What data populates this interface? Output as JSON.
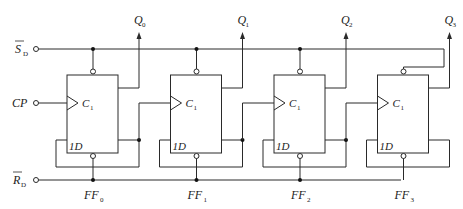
{
  "inputs": {
    "set": {
      "label": "S",
      "subscript": "D",
      "overline": true
    },
    "clock": {
      "label": "CP",
      "subscript": ""
    },
    "reset": {
      "label": "R",
      "subscript": "D",
      "overline": true
    }
  },
  "flip_flops": [
    {
      "name": "FF",
      "index": "0",
      "clock_label": "C",
      "clock_sub": "1",
      "data_label": "1D",
      "output": "Q",
      "output_sub": "0"
    },
    {
      "name": "FF",
      "index": "1",
      "clock_label": "C",
      "clock_sub": "1",
      "data_label": "1D",
      "output": "Q",
      "output_sub": "1"
    },
    {
      "name": "FF",
      "index": "2",
      "clock_label": "C",
      "clock_sub": "1",
      "data_label": "1D",
      "output": "Q",
      "output_sub": "2"
    },
    {
      "name": "FF",
      "index": "3",
      "clock_label": "C",
      "clock_sub": "1",
      "data_label": "1D",
      "output": "Q",
      "output_sub": "3"
    }
  ],
  "colors": {
    "line": "#2a2a2a",
    "background": "#ffffff"
  }
}
